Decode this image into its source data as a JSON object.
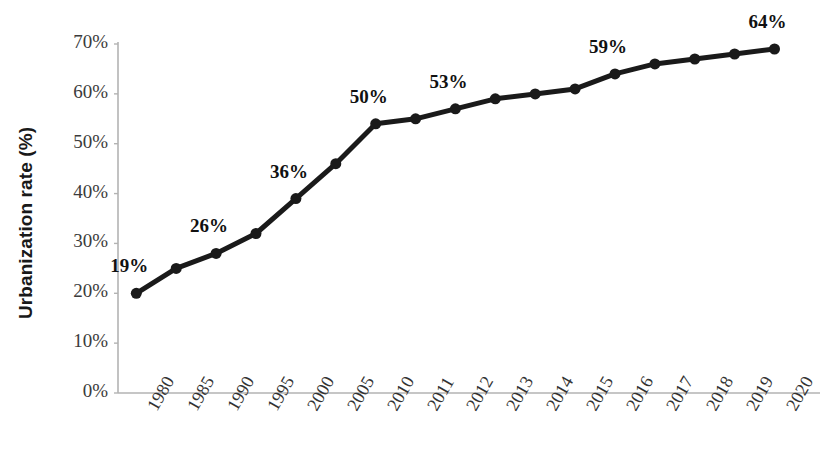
{
  "chart_data": {
    "type": "line",
    "title": "",
    "xlabel": "",
    "ylabel": "Urbanization rate (%)",
    "categories": [
      "1980",
      "1985",
      "1990",
      "1995",
      "2000",
      "2005",
      "2010",
      "2011",
      "2012",
      "2013",
      "2014",
      "2015",
      "2016",
      "2017",
      "2018",
      "2019",
      "2020"
    ],
    "values": [
      20,
      25,
      28,
      32,
      39,
      46,
      54,
      55,
      57,
      59,
      60,
      61,
      64,
      66,
      67,
      68,
      69
    ],
    "point_labels": [
      {
        "category": "1980",
        "text": "19%"
      },
      {
        "category": "1990",
        "text": "26%"
      },
      {
        "category": "2000",
        "text": "36%"
      },
      {
        "category": "2010",
        "text": "50%"
      },
      {
        "category": "2012",
        "text": "53%"
      },
      {
        "category": "2016",
        "text": "59%"
      },
      {
        "category": "2020",
        "text": "64%"
      }
    ],
    "ylim": [
      0,
      70
    ],
    "yticks": [
      0,
      10,
      20,
      30,
      40,
      50,
      60,
      70
    ],
    "ytick_labels": [
      "0%",
      "10%",
      "20%",
      "30%",
      "40%",
      "50%",
      "60%",
      "70%"
    ],
    "grid": false,
    "legend": null,
    "series_color": "#1a1a1a",
    "axis_color": "#b0b0b0",
    "marker": "circle",
    "marker_size": 11,
    "line_width": 5
  },
  "axis": {
    "y_title": "Urbanization rate (%)"
  }
}
